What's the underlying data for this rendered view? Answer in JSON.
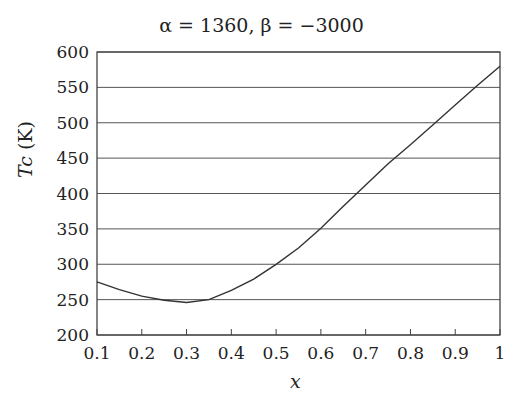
{
  "chart_data": {
    "type": "line",
    "title": "α = 1360,  β = −3000",
    "xlabel": "x",
    "ylabel": "Tc (K)",
    "xlim": [
      0.1,
      1
    ],
    "ylim": [
      200,
      600
    ],
    "xticks": [
      "0.1",
      "0.2",
      "0.3",
      "0.4",
      "0.5",
      "0.6",
      "0.7",
      "0.8",
      "0.9",
      "1"
    ],
    "yticks": [
      "200",
      "250",
      "300",
      "350",
      "400",
      "450",
      "500",
      "550",
      "600"
    ],
    "grid": "horizontal",
    "legend": "none",
    "series": [
      {
        "name": "Tc",
        "x": [
          0.1,
          0.15,
          0.2,
          0.25,
          0.3,
          0.35,
          0.4,
          0.45,
          0.5,
          0.55,
          0.6,
          0.65,
          0.7,
          0.75,
          0.8,
          0.85,
          0.9,
          0.95,
          1.0
        ],
        "y": [
          275,
          264,
          255,
          249,
          246,
          250,
          263,
          279,
          300,
          323,
          351,
          382,
          412,
          442,
          469,
          497,
          525,
          553,
          580
        ]
      }
    ]
  }
}
